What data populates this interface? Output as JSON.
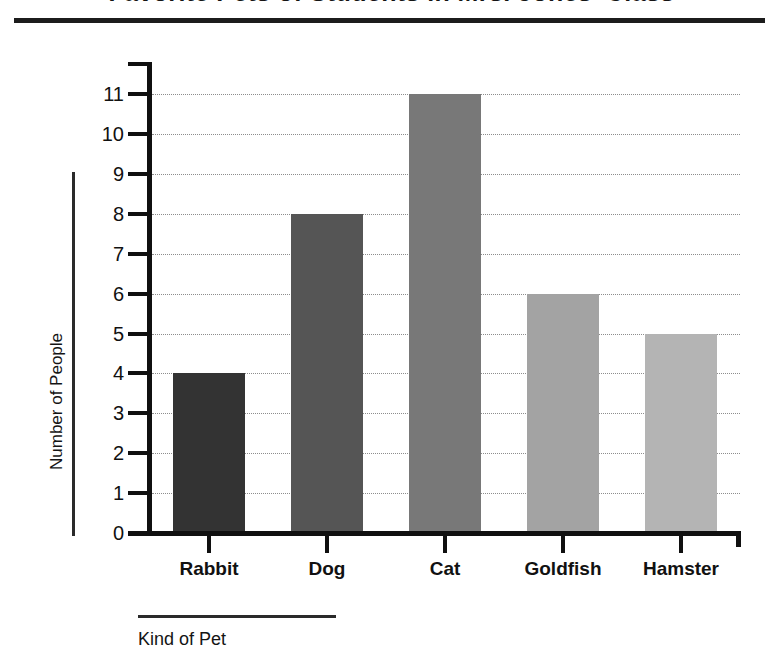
{
  "header": {
    "title": "Favorite Pets of Students in Mrs. Jones' Class",
    "rule_color": "#1c1c1c"
  },
  "chart_data": {
    "type": "bar",
    "title": "Favorite Pets of Students in Mrs. Jones' Class",
    "xlabel": "Kind of Pet",
    "ylabel": "Number of People",
    "categories": [
      "Rabbit",
      "Dog",
      "Cat",
      "Goldfish",
      "Hamster"
    ],
    "values": [
      4,
      8,
      11,
      6,
      5
    ],
    "ylim": [
      0,
      11
    ],
    "ytick_labels": [
      "0",
      "1",
      "2",
      "3",
      "4",
      "5",
      "6",
      "7",
      "8",
      "9",
      "10",
      "11"
    ],
    "grid": true,
    "grid_style": "dotted",
    "grid_color": "#8d8d8d",
    "legend": "none",
    "bar_colors": [
      "#333333",
      "#555555",
      "#787878",
      "#a3a3a3",
      "#b4b4b4"
    ]
  }
}
